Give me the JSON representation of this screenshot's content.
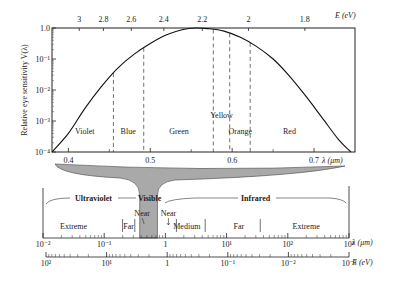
{
  "top_plot": {
    "y_axis_title": "Relative eye sensitivity V(λ)",
    "y_ticks": [
      "1.0",
      "10⁻¹",
      "10⁻²",
      "10⁻³",
      "10⁻⁴"
    ],
    "y_log_range": [
      -4,
      0
    ],
    "x_axis_title": "λ (μm)",
    "x_range_um": [
      0.38,
      0.75
    ],
    "x_ticks": [
      {
        "value": 0.4,
        "label": "0.4"
      },
      {
        "value": 0.5,
        "label": "0.5"
      },
      {
        "value": 0.6,
        "label": "0.6"
      },
      {
        "value": 0.7,
        "label": "0.7"
      }
    ],
    "x_minor_ticks": [
      0.45,
      0.55,
      0.65
    ],
    "top_axis_title": "E (eV)",
    "top_ticks": [
      {
        "value": 3,
        "label": "3"
      },
      {
        "value": 2.8,
        "label": "2.8"
      },
      {
        "value": 2.6,
        "label": "2.6"
      },
      {
        "value": 2.4,
        "label": "2.4"
      },
      {
        "value": 2.2,
        "label": "2.2"
      },
      {
        "value": 2.0,
        "label": "2"
      },
      {
        "value": 1.8,
        "label": "1.8"
      }
    ],
    "boundaries_um": [
      0.455,
      0.492,
      0.577,
      0.597,
      0.622
    ],
    "color_bands": [
      {
        "name": "Violet",
        "center_um": 0.42
      },
      {
        "name": "Blue",
        "center_um": 0.473
      },
      {
        "name": "Green",
        "center_um": 0.535
      },
      {
        "name": "Yellow",
        "center_um": 0.587
      },
      {
        "name": "Orange",
        "center_um": 0.61
      },
      {
        "name": "Red",
        "center_um": 0.67
      }
    ],
    "curve": {
      "peak_um": 0.555,
      "points": [
        [
          0.38,
          -4.0
        ],
        [
          0.4,
          -3.4
        ],
        [
          0.42,
          -2.6
        ],
        [
          0.44,
          -1.9
        ],
        [
          0.46,
          -1.3
        ],
        [
          0.48,
          -0.85
        ],
        [
          0.5,
          -0.5
        ],
        [
          0.52,
          -0.22
        ],
        [
          0.54,
          -0.05
        ],
        [
          0.555,
          0.0
        ],
        [
          0.57,
          -0.02
        ],
        [
          0.59,
          -0.1
        ],
        [
          0.61,
          -0.3
        ],
        [
          0.63,
          -0.6
        ],
        [
          0.65,
          -1.0
        ],
        [
          0.67,
          -1.55
        ],
        [
          0.69,
          -2.2
        ],
        [
          0.71,
          -2.9
        ],
        [
          0.73,
          -3.6
        ],
        [
          0.745,
          -4.0
        ]
      ]
    }
  },
  "spectrum": {
    "regions": {
      "ultraviolet": "Ultraviolet",
      "visible": "Visible",
      "infrared": "Infrared"
    },
    "subregions": [
      {
        "label": "Extreme",
        "center_log": -1.5
      },
      {
        "label": "Far",
        "center_log": -0.6
      },
      {
        "label": "Near",
        "center_log": -0.38
      },
      {
        "label": "Near",
        "center_log": 0.05
      },
      {
        "label": "Medium",
        "center_log": 0.35
      },
      {
        "label": "Far",
        "center_log": 1.2
      },
      {
        "label": "Extreme",
        "center_log": 2.3
      }
    ],
    "subregion_dividers_log": [
      -0.7,
      -0.5,
      0.18,
      0.65,
      1.55
    ],
    "visible_band_log": [
      -0.42,
      -0.13
    ],
    "lambda_axis": {
      "title": "λ (μm)",
      "range_log": [
        -2,
        3
      ],
      "ticks": [
        "10⁻²",
        "10⁻¹",
        "1",
        "10¹",
        "10²",
        "10³"
      ]
    },
    "energy_axis": {
      "title": "E (eV)",
      "ticks": [
        "10²",
        "10¹",
        "1",
        "10⁻¹",
        "10⁻²",
        "10⁻³"
      ]
    }
  }
}
